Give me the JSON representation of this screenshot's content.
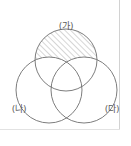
{
  "figure": {
    "type": "venn-diagram",
    "background_color": "#ffffff",
    "stroke_color": "#6e6e6e",
    "hatch_color": "#8a8a8a",
    "frame_color": "#cfcfcf"
  },
  "labels": {
    "top": "(가)",
    "bottom_left": "(나)",
    "bottom_right": "(다)"
  },
  "circles": [
    {
      "name": "circle-top",
      "label": "(가)",
      "cx": 66,
      "cy": 60,
      "r": 31,
      "shaded": true
    },
    {
      "name": "circle-bottom-left",
      "label": "(나)",
      "cx": 49,
      "cy": 90,
      "r": 33,
      "shaded": false
    },
    {
      "name": "circle-bottom-right",
      "label": "(다)",
      "cx": 84,
      "cy": 90,
      "r": 33,
      "shaded": false
    }
  ],
  "hatching": {
    "angle_degrees": 45,
    "spacing_px": 4,
    "stroke_width": 0.7
  },
  "label_positions": {
    "top": {
      "x": 66,
      "y": 29
    },
    "bottom_left": {
      "x": 19,
      "y": 112
    },
    "bottom_right": {
      "x": 112,
      "y": 112
    }
  }
}
